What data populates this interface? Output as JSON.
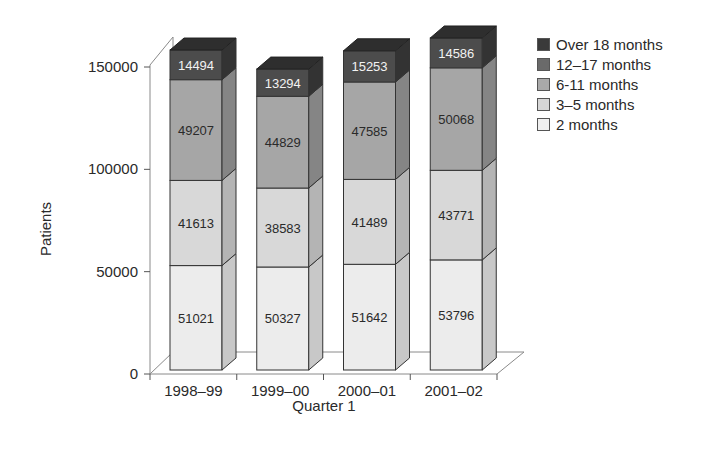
{
  "chart_data": {
    "type": "bar",
    "stacked": true,
    "style": "3d",
    "title": "",
    "xlabel": "Quarter 1",
    "ylabel": "Patients",
    "ylim": [
      0,
      150000
    ],
    "yticks": [
      0,
      50000,
      100000,
      150000
    ],
    "ytick_labels": [
      "0",
      "50000",
      "100000",
      "150000"
    ],
    "categories": [
      "1998–99",
      "1999–00",
      "2000–01",
      "2001–02"
    ],
    "series": [
      {
        "name": "2 months",
        "values": [
          51021,
          50327,
          51642,
          53796
        ],
        "color": "#ececec",
        "label_color": "#2a2a2a"
      },
      {
        "name": "3–5 months",
        "values": [
          41613,
          38583,
          41489,
          43771
        ],
        "color": "#d6d6d6",
        "label_color": "#2a2a2a"
      },
      {
        "name": "6-11 months",
        "values": [
          49207,
          44829,
          47585,
          50068
        ],
        "color": "#a9a9a9",
        "label_color": "#2a2a2a"
      },
      {
        "name": "12–17 months",
        "values": [
          0,
          0,
          0,
          0
        ],
        "color": "#6e6e6e",
        "label_color": "#f0f0f0"
      },
      {
        "name": "Over 18 months",
        "values": [
          14494,
          13294,
          15253,
          14586
        ],
        "color": "#4a4a4a",
        "label_color": "#f0f0f0"
      }
    ],
    "segment_labels": [
      [
        "51021",
        "41613",
        "49207",
        "14494"
      ],
      [
        "50327",
        "38583",
        "44829",
        "13294"
      ],
      [
        "51642",
        "41489",
        "47585",
        "15253"
      ],
      [
        "53796",
        "43771",
        "50068",
        "14586"
      ]
    ],
    "legend": {
      "position": "right",
      "entries": [
        "Over 18 months",
        "12–17 months",
        "6-11 months",
        "3–5 months",
        "2 months"
      ],
      "colors": [
        "#3a3a3a",
        "#6a6a6a",
        "#a9a9a9",
        "#d6d6d6",
        "#efefef"
      ]
    },
    "grid": false
  }
}
